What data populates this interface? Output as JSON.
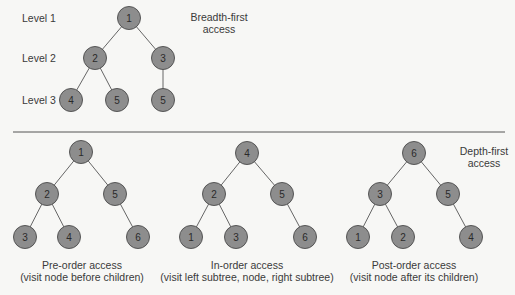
{
  "breadth_first": {
    "title_line1": "Breadth-first",
    "title_line2": "access",
    "levels": [
      "Level 1",
      "Level 2",
      "Level 3"
    ],
    "nodes": [
      {
        "label": "1",
        "x": 129,
        "y": 18
      },
      {
        "label": "2",
        "x": 95,
        "y": 58
      },
      {
        "label": "3",
        "x": 163,
        "y": 58
      },
      {
        "label": "4",
        "x": 71,
        "y": 100
      },
      {
        "label": "5",
        "x": 117,
        "y": 100
      },
      {
        "label": "5",
        "x": 163,
        "y": 100
      }
    ],
    "edges": [
      [
        0,
        1
      ],
      [
        0,
        2
      ],
      [
        1,
        3
      ],
      [
        1,
        4
      ],
      [
        2,
        5
      ]
    ]
  },
  "depth_first": {
    "title_line1": "Depth-first",
    "title_line2": "access",
    "trees": [
      {
        "name": "pre-order",
        "caption_line1": "Pre-order access",
        "caption_line2": "(visit node before children)",
        "caption_x": 82,
        "nodes": [
          {
            "label": "1",
            "x": 81,
            "y": 152
          },
          {
            "label": "2",
            "x": 47,
            "y": 194
          },
          {
            "label": "5",
            "x": 115,
            "y": 194
          },
          {
            "label": "3",
            "x": 25,
            "y": 237
          },
          {
            "label": "4",
            "x": 69,
            "y": 237
          },
          {
            "label": "6",
            "x": 138,
            "y": 237
          }
        ],
        "edges": [
          [
            0,
            1
          ],
          [
            0,
            2
          ],
          [
            1,
            3
          ],
          [
            1,
            4
          ],
          [
            2,
            5
          ]
        ]
      },
      {
        "name": "in-order",
        "caption_line1": "In-order access",
        "caption_line2": "(visit left subtree, node, right subtree)",
        "caption_x": 247,
        "nodes": [
          {
            "label": "4",
            "x": 247,
            "y": 153
          },
          {
            "label": "2",
            "x": 214,
            "y": 194
          },
          {
            "label": "5",
            "x": 282,
            "y": 194
          },
          {
            "label": "1",
            "x": 191,
            "y": 237
          },
          {
            "label": "3",
            "x": 236,
            "y": 237
          },
          {
            "label": "6",
            "x": 305,
            "y": 237
          }
        ],
        "edges": [
          [
            0,
            1
          ],
          [
            0,
            2
          ],
          [
            1,
            3
          ],
          [
            1,
            4
          ],
          [
            2,
            5
          ]
        ]
      },
      {
        "name": "post-order",
        "caption_line1": "Post-order access",
        "caption_line2": "(visit node after its children)",
        "caption_x": 414,
        "nodes": [
          {
            "label": "6",
            "x": 414,
            "y": 153
          },
          {
            "label": "3",
            "x": 380,
            "y": 194
          },
          {
            "label": "5",
            "x": 448,
            "y": 194
          },
          {
            "label": "1",
            "x": 358,
            "y": 237
          },
          {
            "label": "2",
            "x": 403,
            "y": 237
          },
          {
            "label": "4",
            "x": 471,
            "y": 237
          }
        ],
        "edges": [
          [
            0,
            1
          ],
          [
            0,
            2
          ],
          [
            1,
            3
          ],
          [
            1,
            4
          ],
          [
            2,
            5
          ]
        ]
      }
    ]
  },
  "colors": {
    "node_fill": "#8d8d8d",
    "node_stroke": "#555555",
    "edge": "#666666",
    "divider": "#555555",
    "background": "#f7f7f5"
  }
}
